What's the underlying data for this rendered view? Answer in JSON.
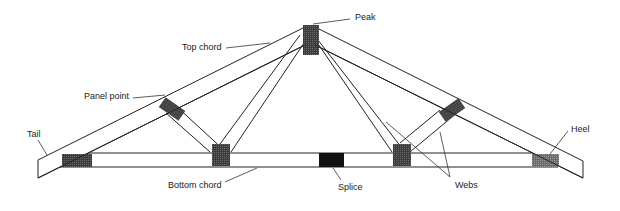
{
  "diagram": {
    "labels": {
      "peak": "Peak",
      "top_chord": "Top chord",
      "panel_point": "Panel point",
      "tail": "Tail",
      "heel": "Heel",
      "bottom_chord": "Bottom chord",
      "splice": "Splice",
      "webs": "Webs"
    },
    "colors": {
      "line": "#222222",
      "plate": "#3a3a3a",
      "splice": "#111111",
      "heel_plate": "#6a6a6a"
    }
  }
}
